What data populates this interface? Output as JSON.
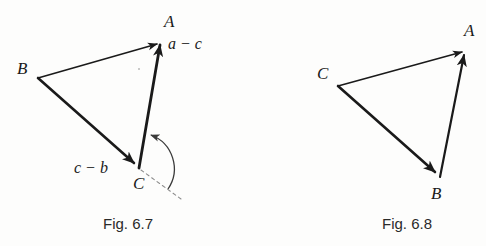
{
  "page": {
    "background_color": "#fdfdfc",
    "ink_color": "#1a1a1a"
  },
  "figures": [
    {
      "id": "fig-6-7",
      "caption": "Fig. 6.7",
      "caption_pos": {
        "x": 103,
        "y": 216
      },
      "vertices": [
        {
          "name": "A",
          "label": "A",
          "x": 162,
          "y": 38,
          "label_x": 164,
          "label_y": 13
        },
        {
          "name": "B",
          "label": "B",
          "x": 38,
          "y": 78,
          "label_x": 17,
          "label_y": 60
        },
        {
          "name": "C",
          "label": "C",
          "x": 139,
          "y": 168,
          "label_x": 133,
          "label_y": 175
        }
      ],
      "vectors": [
        {
          "from": "B",
          "to": "A",
          "label": "",
          "weight": 1.6,
          "arrow": true
        },
        {
          "from": "B",
          "to": "C",
          "label": "c − b",
          "weight": 2.6,
          "arrow": true,
          "label_x": 74,
          "label_y": 160
        },
        {
          "from": "C",
          "to": "A",
          "label": "a − c",
          "weight": 2.6,
          "arrow": true,
          "label_x": 168,
          "label_y": 36
        }
      ],
      "dashed_ray": {
        "from_x": 139,
        "from_y": 168,
        "to_x": 180,
        "to_y": 198
      },
      "angle_arc": {
        "present": true,
        "center_x": 139,
        "center_y": 168,
        "radius": 36,
        "start_deg": 36,
        "end_deg": -105,
        "arrow": true
      },
      "speck": {
        "x": 138,
        "y": 68
      }
    },
    {
      "id": "fig-6-8",
      "caption": "Fig. 6.8",
      "caption_pos": {
        "x": 382,
        "y": 216
      },
      "vertices": [
        {
          "name": "A",
          "label": "A",
          "x": 467,
          "y": 48,
          "label_x": 464,
          "label_y": 22
        },
        {
          "name": "C",
          "label": "C",
          "x": 338,
          "y": 86,
          "label_x": 317,
          "label_y": 65
        },
        {
          "name": "B",
          "label": "B",
          "x": 440,
          "y": 177,
          "label_x": 431,
          "label_y": 185
        }
      ],
      "vectors": [
        {
          "from": "C",
          "to": "A",
          "label": "",
          "weight": 1.6,
          "arrow": true
        },
        {
          "from": "C",
          "to": "B",
          "label": "",
          "weight": 2.6,
          "arrow": true
        },
        {
          "from": "B",
          "to": "A",
          "label": "",
          "weight": 2.2,
          "arrow": true
        }
      ],
      "dashed_ray": null,
      "angle_arc": {
        "present": false
      }
    }
  ]
}
